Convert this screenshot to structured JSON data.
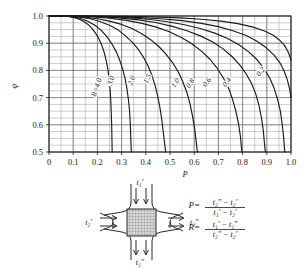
{
  "chart_data": {
    "type": "line",
    "title": "",
    "xlabel": "P",
    "ylabel": "ψ",
    "xlim": [
      0,
      1.0
    ],
    "ylim": [
      0.5,
      1.0
    ],
    "grid": true,
    "x_major_step": 0.1,
    "x_minor_step": 0.05,
    "y_major_step": 0.1,
    "y_minor_step": 0.025,
    "xticks": [
      "0",
      "0.1",
      "0.2",
      "0.3",
      "0.4",
      "0.5",
      "0.6",
      "0.7",
      "0.8",
      "0.9",
      "1.0"
    ],
    "xtick_values": [
      0,
      0.1,
      0.2,
      0.3,
      0.4,
      0.5,
      0.6,
      0.7,
      0.8,
      0.9,
      1.0
    ],
    "yticks": [
      "0.5",
      "0.6",
      "0.7",
      "0.8",
      "0.9",
      "1.0"
    ],
    "ytick_values": [
      0.5,
      0.6,
      0.7,
      0.8,
      0.9,
      1.0
    ],
    "legend_position": "inline-on-curves",
    "series": [
      {
        "name": "R=4.0",
        "label": "R=4.0",
        "label_x": 0.205,
        "label_y": 0.735,
        "label_rotation": -72,
        "points": [
          [
            0.0,
            1.0
          ],
          [
            0.05,
            1.0
          ],
          [
            0.08,
            0.998
          ],
          [
            0.1,
            0.995
          ],
          [
            0.12,
            0.99
          ],
          [
            0.14,
            0.982
          ],
          [
            0.16,
            0.97
          ],
          [
            0.175,
            0.957
          ],
          [
            0.19,
            0.94
          ],
          [
            0.205,
            0.918
          ],
          [
            0.218,
            0.893
          ],
          [
            0.228,
            0.866
          ],
          [
            0.236,
            0.838
          ],
          [
            0.243,
            0.806
          ],
          [
            0.248,
            0.772
          ],
          [
            0.252,
            0.735
          ],
          [
            0.255,
            0.695
          ],
          [
            0.257,
            0.65
          ],
          [
            0.259,
            0.6
          ],
          [
            0.26,
            0.55
          ],
          [
            0.261,
            0.5
          ]
        ]
      },
      {
        "name": "3.0",
        "label": "3.0",
        "label_x": 0.265,
        "label_y": 0.76,
        "label_rotation": -72,
        "points": [
          [
            0.0,
            1.0
          ],
          [
            0.06,
            1.0
          ],
          [
            0.1,
            0.997
          ],
          [
            0.13,
            0.991
          ],
          [
            0.16,
            0.981
          ],
          [
            0.19,
            0.966
          ],
          [
            0.215,
            0.948
          ],
          [
            0.24,
            0.923
          ],
          [
            0.26,
            0.897
          ],
          [
            0.278,
            0.868
          ],
          [
            0.292,
            0.838
          ],
          [
            0.305,
            0.803
          ],
          [
            0.315,
            0.768
          ],
          [
            0.322,
            0.733
          ],
          [
            0.328,
            0.695
          ],
          [
            0.333,
            0.65
          ],
          [
            0.336,
            0.6
          ],
          [
            0.338,
            0.55
          ],
          [
            0.34,
            0.5
          ]
        ]
      },
      {
        "name": "2.0",
        "label": "2.0",
        "label_x": 0.35,
        "label_y": 0.76,
        "label_rotation": -68,
        "points": [
          [
            0.0,
            1.0
          ],
          [
            0.07,
            1.0
          ],
          [
            0.12,
            0.997
          ],
          [
            0.17,
            0.99
          ],
          [
            0.21,
            0.98
          ],
          [
            0.25,
            0.966
          ],
          [
            0.285,
            0.949
          ],
          [
            0.315,
            0.928
          ],
          [
            0.345,
            0.903
          ],
          [
            0.37,
            0.876
          ],
          [
            0.392,
            0.846
          ],
          [
            0.41,
            0.815
          ],
          [
            0.425,
            0.782
          ],
          [
            0.438,
            0.746
          ],
          [
            0.448,
            0.71
          ],
          [
            0.458,
            0.665
          ],
          [
            0.466,
            0.62
          ],
          [
            0.472,
            0.575
          ],
          [
            0.478,
            0.53
          ],
          [
            0.482,
            0.5
          ]
        ]
      },
      {
        "name": "1.5",
        "label": "1.5",
        "label_x": 0.415,
        "label_y": 0.765,
        "label_rotation": -62,
        "points": [
          [
            0.0,
            1.0
          ],
          [
            0.08,
            1.0
          ],
          [
            0.14,
            0.997
          ],
          [
            0.2,
            0.99
          ],
          [
            0.25,
            0.981
          ],
          [
            0.3,
            0.969
          ],
          [
            0.345,
            0.953
          ],
          [
            0.385,
            0.934
          ],
          [
            0.42,
            0.913
          ],
          [
            0.455,
            0.887
          ],
          [
            0.485,
            0.858
          ],
          [
            0.512,
            0.827
          ],
          [
            0.535,
            0.793
          ],
          [
            0.553,
            0.758
          ],
          [
            0.57,
            0.718
          ],
          [
            0.583,
            0.676
          ],
          [
            0.593,
            0.632
          ],
          [
            0.602,
            0.585
          ],
          [
            0.608,
            0.54
          ],
          [
            0.613,
            0.5
          ]
        ]
      },
      {
        "name": "1.0",
        "label": "1.0",
        "label_x": 0.53,
        "label_y": 0.75,
        "label_rotation": -58,
        "points": [
          [
            0.0,
            1.0
          ],
          [
            0.1,
            1.0
          ],
          [
            0.18,
            0.997
          ],
          [
            0.25,
            0.992
          ],
          [
            0.32,
            0.984
          ],
          [
            0.38,
            0.974
          ],
          [
            0.44,
            0.96
          ],
          [
            0.495,
            0.943
          ],
          [
            0.545,
            0.922
          ],
          [
            0.59,
            0.898
          ],
          [
            0.63,
            0.871
          ],
          [
            0.665,
            0.841
          ],
          [
            0.695,
            0.808
          ],
          [
            0.72,
            0.773
          ],
          [
            0.742,
            0.735
          ],
          [
            0.758,
            0.695
          ],
          [
            0.772,
            0.65
          ],
          [
            0.783,
            0.605
          ],
          [
            0.791,
            0.558
          ],
          [
            0.797,
            0.5
          ]
        ]
      },
      {
        "name": "0.8",
        "label": "0.8",
        "label_x": 0.592,
        "label_y": 0.748,
        "label_rotation": -56,
        "points": [
          [
            0.0,
            1.0
          ],
          [
            0.11,
            1.0
          ],
          [
            0.2,
            0.998
          ],
          [
            0.29,
            0.993
          ],
          [
            0.37,
            0.986
          ],
          [
            0.44,
            0.976
          ],
          [
            0.51,
            0.962
          ],
          [
            0.57,
            0.946
          ],
          [
            0.625,
            0.927
          ],
          [
            0.675,
            0.905
          ],
          [
            0.718,
            0.88
          ],
          [
            0.755,
            0.852
          ],
          [
            0.788,
            0.82
          ],
          [
            0.815,
            0.787
          ],
          [
            0.838,
            0.75
          ],
          [
            0.855,
            0.712
          ],
          [
            0.868,
            0.67
          ],
          [
            0.878,
            0.625
          ],
          [
            0.886,
            0.575
          ],
          [
            0.891,
            0.525
          ],
          [
            0.894,
            0.5
          ]
        ]
      },
      {
        "name": "0.6",
        "label": "0.6",
        "label_x": 0.66,
        "label_y": 0.752,
        "label_rotation": -54,
        "points": [
          [
            0.0,
            1.0
          ],
          [
            0.12,
            1.0
          ],
          [
            0.22,
            0.998
          ],
          [
            0.32,
            0.994
          ],
          [
            0.41,
            0.988
          ],
          [
            0.49,
            0.979
          ],
          [
            0.56,
            0.968
          ],
          [
            0.625,
            0.954
          ],
          [
            0.685,
            0.937
          ],
          [
            0.738,
            0.917
          ],
          [
            0.785,
            0.894
          ],
          [
            0.825,
            0.868
          ],
          [
            0.86,
            0.839
          ],
          [
            0.888,
            0.807
          ],
          [
            0.912,
            0.772
          ],
          [
            0.93,
            0.735
          ],
          [
            0.944,
            0.695
          ],
          [
            0.956,
            0.65
          ],
          [
            0.964,
            0.6
          ],
          [
            0.97,
            0.55
          ],
          [
            0.974,
            0.5
          ]
        ]
      },
      {
        "name": "0.4",
        "label": "0.4",
        "label_x": 0.742,
        "label_y": 0.752,
        "label_rotation": -52,
        "points": [
          [
            0.0,
            1.0
          ],
          [
            0.14,
            1.0
          ],
          [
            0.25,
            0.999
          ],
          [
            0.36,
            0.995
          ],
          [
            0.46,
            0.99
          ],
          [
            0.55,
            0.983
          ],
          [
            0.63,
            0.973
          ],
          [
            0.7,
            0.961
          ],
          [
            0.76,
            0.946
          ],
          [
            0.815,
            0.928
          ],
          [
            0.86,
            0.907
          ],
          [
            0.898,
            0.883
          ],
          [
            0.93,
            0.856
          ],
          [
            0.955,
            0.827
          ],
          [
            0.972,
            0.797
          ],
          [
            0.985,
            0.765
          ],
          [
            0.994,
            0.733
          ],
          [
            1.0,
            0.7
          ]
        ]
      },
      {
        "name": "0.2",
        "label": "0.2",
        "label_x": 0.882,
        "label_y": 0.79,
        "label_rotation": -52,
        "points": [
          [
            0.0,
            1.0
          ],
          [
            0.16,
            1.0
          ],
          [
            0.3,
            0.999
          ],
          [
            0.43,
            0.997
          ],
          [
            0.54,
            0.993
          ],
          [
            0.63,
            0.988
          ],
          [
            0.71,
            0.981
          ],
          [
            0.78,
            0.972
          ],
          [
            0.84,
            0.96
          ],
          [
            0.888,
            0.946
          ],
          [
            0.925,
            0.93
          ],
          [
            0.952,
            0.912
          ],
          [
            0.972,
            0.893
          ],
          [
            0.986,
            0.872
          ],
          [
            0.995,
            0.852
          ],
          [
            1.0,
            0.838
          ]
        ]
      }
    ]
  },
  "diagram": {
    "name": "crossflow-heat-exchanger",
    "inlet_top": "t₁′",
    "outlet_bottom": "t₁″",
    "inlet_left": "t₂′",
    "outlet_right": "t₂″"
  },
  "formulas": [
    {
      "name": "P",
      "lhs": "P=",
      "numerator": "t₂″ − t₂′",
      "denominator": "t₁′ − t₂′"
    },
    {
      "name": "R",
      "lhs": "R=",
      "numerator": "t₁′ − t₁″",
      "denominator": "t₂″ − t₂′"
    }
  ],
  "colors": {
    "curve": "#1a1a1a",
    "grid": "#9a9a9a",
    "axis": "#1a1a1a",
    "text": "#1a1a1a",
    "background": "#ffffff",
    "core_hatch": "#8a8a8a"
  }
}
